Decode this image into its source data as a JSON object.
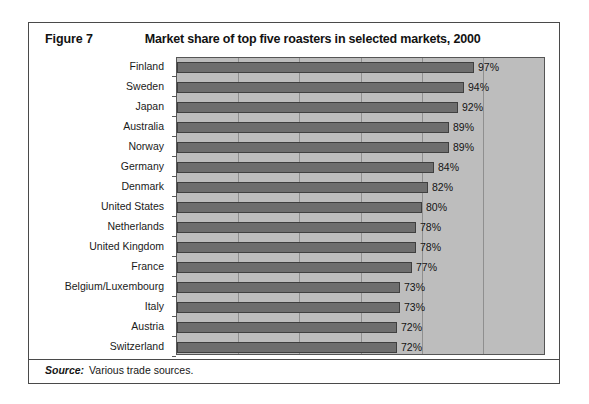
{
  "figure": {
    "number_label": "Figure 7",
    "title": "Market share of top five roasters in selected markets, 2000"
  },
  "source": {
    "label": "Source:",
    "text": "Various trade sources."
  },
  "style": {
    "bar_color": "#6e6e6e",
    "bar_border_color": "#3f3f3f",
    "plot_background": "#bdbdbd",
    "gridline_color": "#8f8f8f",
    "frame_color": "#4a4a4a",
    "page_background": "#ffffff"
  },
  "chart_data": {
    "type": "bar",
    "orientation": "horizontal",
    "title": "Market share of top five roasters in selected markets, 2000",
    "xlabel": "",
    "ylabel": "",
    "xlim": [
      0,
      120
    ],
    "gridlines": [
      20,
      40,
      60,
      80,
      100,
      120
    ],
    "grid": true,
    "legend": false,
    "value_suffix": "%",
    "categories": [
      "Finland",
      "Sweden",
      "Japan",
      "Australia",
      "Norway",
      "Germany",
      "Denmark",
      "United States",
      "Netherlands",
      "United Kingdom",
      "France",
      "Belgium/Luxembourg",
      "Italy",
      "Austria",
      "Switzerland"
    ],
    "values": [
      97,
      94,
      92,
      89,
      89,
      84,
      82,
      80,
      78,
      78,
      77,
      73,
      73,
      72,
      72
    ],
    "data_labels": [
      "97%",
      "94%",
      "92%",
      "89%",
      "89%",
      "84%",
      "82%",
      "80%",
      "78%",
      "78%",
      "77%",
      "73%",
      "73%",
      "72%",
      "72%"
    ]
  }
}
